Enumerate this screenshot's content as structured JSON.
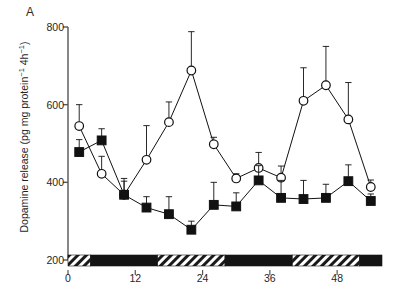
{
  "figure": {
    "panel_label": "A",
    "background_color": "#ffffff",
    "ink_color": "#111111"
  },
  "chart_data": {
    "type": "line",
    "title": "",
    "subtitle": "",
    "panel": "A",
    "xlabel": "",
    "ylabel": "Dopamine release (pg mg protein⁻¹ 4h⁻¹)",
    "ylabel_parts": {
      "text_main": "Dopamine release (pg mg protein",
      "sup1": "−1",
      "text_mid": " 4h",
      "sup2": "−1",
      "text_end": ")"
    },
    "xlim": [
      0,
      56
    ],
    "ylim": [
      200,
      800
    ],
    "xticks": [
      0,
      12,
      24,
      36,
      48
    ],
    "xticklabels": [
      "0",
      "12",
      "24",
      "36",
      "48"
    ],
    "yticks": [
      200,
      400,
      600,
      800
    ],
    "yticklabels": [
      "200",
      "400",
      "600",
      "800"
    ],
    "grid": false,
    "legend": "none",
    "x": [
      2,
      6,
      10,
      14,
      18,
      22,
      26,
      30,
      34,
      38,
      42,
      46,
      50,
      54
    ],
    "series": [
      {
        "name": "open-circles",
        "marker": "open-circle",
        "marker_fill": "#ffffff",
        "marker_edge": "#111111",
        "line_color": "#111111",
        "values": [
          545,
          422,
          368,
          458,
          555,
          688,
          498,
          410,
          437,
          412,
          610,
          650,
          562,
          388
        ],
        "errors_upper": [
          55,
          45,
          35,
          88,
          52,
          100,
          18,
          12,
          40,
          30,
          85,
          100,
          95,
          18
        ],
        "errors_lower": [
          0,
          0,
          0,
          0,
          0,
          0,
          0,
          0,
          0,
          0,
          0,
          0,
          0,
          0
        ]
      },
      {
        "name": "filled-squares",
        "marker": "filled-square",
        "marker_fill": "#111111",
        "marker_edge": "#111111",
        "line_color": "#111111",
        "values": [
          478,
          508,
          368,
          335,
          318,
          278,
          342,
          338,
          405,
          360,
          357,
          360,
          403,
          352
        ],
        "errors_upper": [
          32,
          30,
          42,
          28,
          45,
          22,
          58,
          35,
          38,
          45,
          48,
          35,
          42,
          18
        ],
        "errors_lower": [
          0,
          0,
          0,
          0,
          0,
          0,
          0,
          0,
          0,
          0,
          0,
          0,
          0,
          0
        ]
      }
    ],
    "light_dark_bar": {
      "description": "Horizontal lighting bar along the x-axis: hatched segments = light phase, solid black segments = dark phase",
      "y_value": 200,
      "segments": [
        {
          "start": 0,
          "end": 4,
          "phase": "light"
        },
        {
          "start": 4,
          "end": 16,
          "phase": "dark"
        },
        {
          "start": 16,
          "end": 28,
          "phase": "light"
        },
        {
          "start": 28,
          "end": 40,
          "phase": "dark"
        },
        {
          "start": 40,
          "end": 52,
          "phase": "light"
        },
        {
          "start": 52,
          "end": 56,
          "phase": "dark"
        }
      ]
    }
  }
}
